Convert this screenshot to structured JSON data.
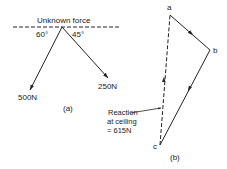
{
  "figure_a": {
    "top_label": "Unknown force",
    "angle_left": "60°",
    "angle_right": "45°",
    "force_left": "500N",
    "force_right": "250N",
    "caption": "(a)"
  },
  "figure_b": {
    "point_a": "a",
    "point_b": "b",
    "point_c": "c",
    "reaction_line1": "Reaction",
    "reaction_line2": "at ceiling",
    "reaction_line3": "= 615N",
    "caption": "(b)"
  },
  "colors": {
    "ink": "#222222",
    "background": "#ffffff"
  }
}
